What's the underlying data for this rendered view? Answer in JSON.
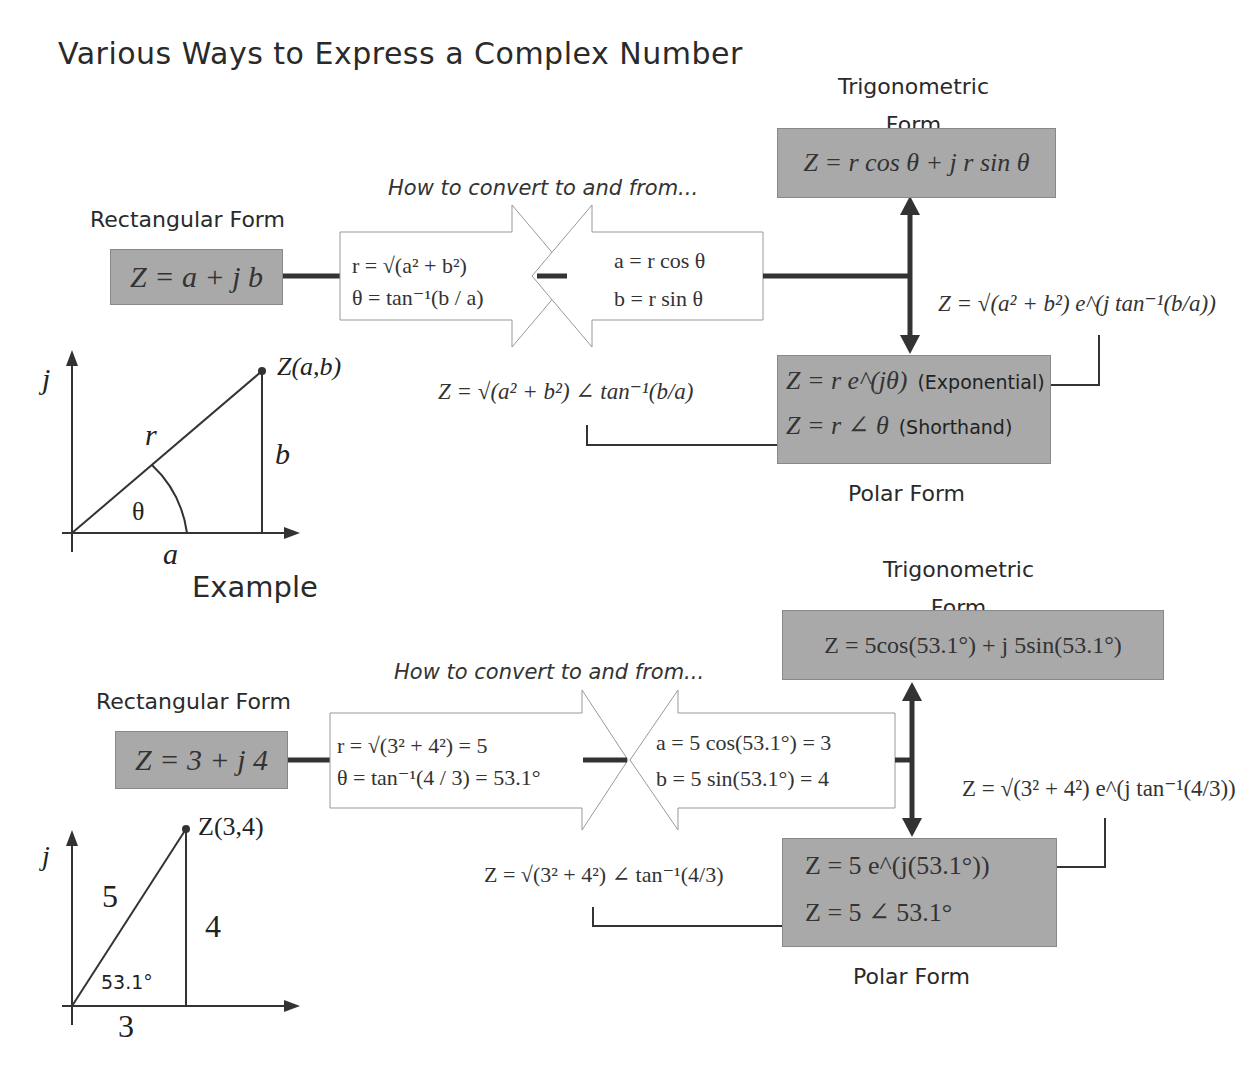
{
  "title": "Various Ways to Express a Complex Number",
  "general": {
    "rectangular": {
      "label": "Rectangular Form",
      "equation": "Z = a + j b"
    },
    "convert_label": "How to convert to and from...",
    "to_polar": {
      "line1": "r = √(a² + b²)",
      "line2": "θ = tan⁻¹(b / a)"
    },
    "to_rect": {
      "line1": "a = r cos θ",
      "line2": "b = r sin θ"
    },
    "trigonometric": {
      "label_line1": "Trigonometric",
      "label_line2": "Form",
      "equation": "Z = r cos θ + j r sin θ"
    },
    "polar": {
      "label": "Polar Form",
      "exponential_eq": "Z = r e^(jθ)",
      "exponential_note": "(Exponential)",
      "shorthand_eq": "Z = r ∠ θ",
      "shorthand_note": "(Shorthand)"
    },
    "exp_expanded": "Z = √(a² + b²) e^(j tan⁻¹(b/a))",
    "angle_expanded": "Z = √(a² + b²) ∠ tan⁻¹(b/a)",
    "graph": {
      "axis_label": "j",
      "point_label": "Z(a,b)",
      "hyp_label": "r",
      "opp_label": "b",
      "adj_label": "a",
      "angle_label": "θ"
    }
  },
  "example": {
    "heading": "Example",
    "rectangular": {
      "label": "Rectangular Form",
      "equation": "Z = 3 + j 4"
    },
    "convert_label": "How to convert to and from...",
    "to_polar": {
      "line1": "r = √(3² + 4²) = 5",
      "line2": "θ = tan⁻¹(4 / 3) = 53.1°"
    },
    "to_rect": {
      "line1": "a = 5 cos(53.1°) = 3",
      "line2": "b = 5 sin(53.1°) = 4"
    },
    "trigonometric": {
      "label_line1": "Trigonometric",
      "label_line2": "Form",
      "equation": "Z = 5cos(53.1°) + j 5sin(53.1°)"
    },
    "polar": {
      "label": "Polar Form",
      "exponential_eq": "Z = 5 e^(j(53.1°))",
      "shorthand_eq": "Z = 5 ∠ 53.1°"
    },
    "exp_expanded": "Z = √(3² + 4²) e^(j tan⁻¹(4/3))",
    "angle_expanded": "Z = √(3² + 4²) ∠ tan⁻¹(4/3)",
    "graph": {
      "axis_label": "j",
      "point_label": "Z(3,4)",
      "hyp_label": "5",
      "opp_label": "4",
      "adj_label": "3",
      "angle_label": "53.1°"
    }
  },
  "colors": {
    "box_fill": "#a9a9a9",
    "line": "#333333",
    "background": "#ffffff"
  }
}
